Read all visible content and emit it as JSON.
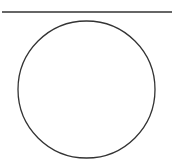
{
  "diagram": {
    "background": "#ffffff",
    "stroke_color": "#333333",
    "shapes": [
      {
        "type": "line",
        "name": "horizontal-line",
        "x1": 2,
        "y1": 12,
        "x2": 172,
        "y2": 12,
        "stroke_width": 1.4
      },
      {
        "type": "circle",
        "name": "circle",
        "cx": 86.5,
        "cy": 89.5,
        "r": 68.5,
        "stroke_width": 1.3,
        "fill": "none"
      }
    ]
  }
}
